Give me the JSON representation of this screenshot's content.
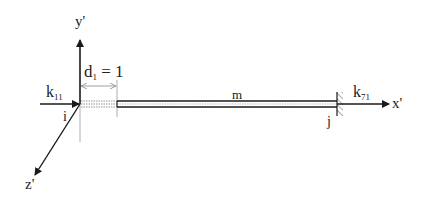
{
  "diagram": {
    "labels": {
      "y_axis": "y'",
      "x_axis": "x'",
      "z_axis": "z'",
      "node_i": "i",
      "node_j": "j",
      "member": "m",
      "k_left_base": "k",
      "k_left_sub": "11",
      "k_right_base": "k",
      "k_right_sub": "71",
      "d_base": "d",
      "d_sub": "1",
      "d_eq": " = 1"
    },
    "colors": {
      "line": "#1a1a1a",
      "dim": "#888888"
    }
  }
}
